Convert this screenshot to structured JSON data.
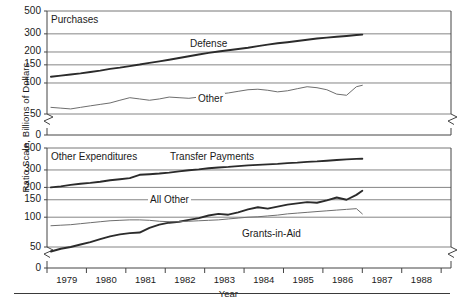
{
  "axis": {
    "y_title": "Ratio Scale, Billions of Dollars",
    "x_title": "Year",
    "y_ticks": [
      "500",
      "300",
      "200",
      "150",
      "100",
      "50",
      "0"
    ],
    "x_ticks": [
      "1979",
      "1980",
      "1981",
      "1982",
      "1983",
      "1984",
      "1985",
      "1986",
      "1987",
      "1988"
    ]
  },
  "panels": {
    "top": {
      "title": "Purchases"
    },
    "bottom": {
      "title": "Other Expenditures"
    }
  },
  "labels": {
    "defense": "Defense",
    "other": "Other",
    "transfer_payments": "Transfer Payments",
    "all_other": "All Other",
    "grants_in_aid": "Grants-in-Aid"
  },
  "colors": {
    "line_dark": "#2b2b2b",
    "line_light": "#6e6e6e",
    "grid": "#777777",
    "frame": "#444444",
    "text": "#1a1a1a"
  },
  "chart_data": {
    "type": "line",
    "title": "",
    "xlabel": "Year",
    "ylabel": "Ratio Scale, Billions of Dollars",
    "scale": "log",
    "ylim": [
      40,
      500
    ],
    "yticks": [
      50,
      100,
      150,
      200,
      300,
      500
    ],
    "xlim": [
      1978.5,
      1988.75
    ],
    "xticks": [
      1979,
      1980,
      1981,
      1982,
      1983,
      1984,
      1985,
      1986,
      1987,
      1988
    ],
    "grid": true,
    "legend": "inline-annotations",
    "axis_break": "between 0 and 50 on y-axis (both panels)",
    "panels": [
      {
        "name": "Purchases",
        "series": [
          {
            "name": "Defense",
            "style": "thick",
            "x": [
              1978.6,
              1978.85,
              1979.1,
              1979.35,
              1979.6,
              1979.85,
              1980.1,
              1980.35,
              1980.6,
              1980.85,
              1981.1,
              1981.35,
              1981.6,
              1981.85,
              1982.1,
              1982.35,
              1982.6,
              1982.85,
              1983.1,
              1983.35,
              1983.6,
              1983.85,
              1984.1,
              1984.35,
              1984.6,
              1984.85,
              1985.1,
              1985.35,
              1985.6,
              1985.85,
              1986.1,
              1986.35,
              1986.5
            ],
            "y": [
              115,
              118,
              121,
              124,
              128,
              132,
              137,
              141,
              146,
              151,
              157,
              162,
              168,
              175,
              182,
              189,
              196,
              202,
              208,
              214,
              220,
              228,
              236,
              243,
              249,
              256,
              263,
              270,
              276,
              281,
              286,
              292,
              295
            ]
          },
          {
            "name": "Other",
            "style": "thin",
            "x": [
              1978.6,
              1978.85,
              1979.1,
              1979.35,
              1979.6,
              1979.85,
              1980.1,
              1980.35,
              1980.6,
              1980.85,
              1981.1,
              1981.35,
              1981.6,
              1981.85,
              1982.1,
              1982.35,
              1982.6,
              1982.85,
              1983.1,
              1983.35,
              1983.6,
              1983.85,
              1984.1,
              1984.35,
              1984.6,
              1984.85,
              1985.1,
              1985.35,
              1985.6,
              1985.85,
              1986.1,
              1986.35,
              1986.5
            ],
            "y": [
              58,
              57,
              56,
              58,
              60,
              62,
              64,
              68,
              72,
              70,
              68,
              70,
              73,
              72,
              71,
              73,
              76,
              78,
              80,
              83,
              86,
              87,
              85,
              82,
              84,
              88,
              92,
              90,
              86,
              78,
              76,
              92,
              95
            ]
          }
        ]
      },
      {
        "name": "Other Expenditures",
        "series": [
          {
            "name": "Transfer Payments",
            "style": "thick",
            "x": [
              1978.6,
              1978.85,
              1979.1,
              1979.35,
              1979.6,
              1979.85,
              1980.1,
              1980.35,
              1980.6,
              1980.85,
              1981.1,
              1981.35,
              1981.6,
              1981.85,
              1982.1,
              1982.35,
              1982.6,
              1982.85,
              1983.1,
              1983.35,
              1983.6,
              1983.85,
              1984.1,
              1984.35,
              1984.6,
              1984.85,
              1985.1,
              1985.35,
              1985.6,
              1985.85,
              1986.1,
              1986.35,
              1986.5
            ],
            "y": [
              200,
              205,
              212,
              218,
              222,
              228,
              236,
              242,
              248,
              268,
              272,
              276,
              282,
              290,
              298,
              304,
              312,
              318,
              322,
              328,
              334,
              338,
              342,
              346,
              352,
              356,
              362,
              366,
              372,
              378,
              384,
              388,
              390
            ]
          },
          {
            "name": "All Other",
            "style": "thick",
            "x": [
              1978.6,
              1978.85,
              1979.1,
              1979.35,
              1979.6,
              1979.85,
              1980.1,
              1980.35,
              1980.6,
              1980.85,
              1981.1,
              1981.35,
              1981.6,
              1981.85,
              1982.1,
              1982.35,
              1982.6,
              1982.85,
              1983.1,
              1983.35,
              1983.6,
              1983.85,
              1984.1,
              1984.35,
              1984.6,
              1984.85,
              1985.1,
              1985.35,
              1985.6,
              1985.85,
              1986.1,
              1986.35,
              1986.5
            ],
            "y": [
              45,
              48,
              50,
              53,
              56,
              60,
              64,
              67,
              69,
              70,
              78,
              84,
              88,
              90,
              94,
              98,
              104,
              108,
              106,
              112,
              120,
              126,
              122,
              128,
              134,
              138,
              142,
              140,
              148,
              158,
              150,
              168,
              185
            ]
          },
          {
            "name": "Grants-in-Aid",
            "style": "thin",
            "x": [
              1978.6,
              1978.85,
              1979.1,
              1979.35,
              1979.6,
              1979.85,
              1980.1,
              1980.35,
              1980.6,
              1980.85,
              1981.1,
              1981.35,
              1981.6,
              1981.85,
              1982.1,
              1982.35,
              1982.6,
              1982.85,
              1983.1,
              1983.35,
              1983.6,
              1983.85,
              1984.1,
              1984.35,
              1984.6,
              1984.85,
              1985.1,
              1985.35,
              1985.6,
              1985.85,
              1986.1,
              1986.35,
              1986.5
            ],
            "y": [
              82,
              83,
              84,
              86,
              88,
              90,
              92,
              93,
              94,
              94,
              93,
              91,
              90,
              90,
              91,
              92,
              93,
              94,
              96,
              98,
              100,
              101,
              103,
              105,
              108,
              110,
              112,
              114,
              116,
              118,
              120,
              122,
              108
            ]
          }
        ]
      }
    ]
  }
}
